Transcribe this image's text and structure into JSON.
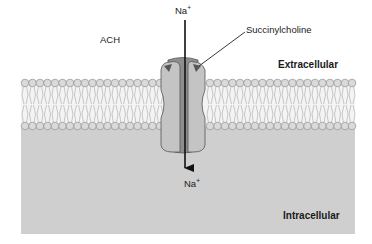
{
  "figure": {
    "labels": {
      "ach": "ACH",
      "succinylcholine": "Succinylcholine",
      "extracellular": "Extracellular",
      "intracellular": "Intracellular",
      "ion_top": {
        "base": "Na",
        "charge": "+"
      },
      "ion_bottom": {
        "base": "Na",
        "charge": "+"
      }
    },
    "colors": {
      "background": "#ffffff",
      "intracellular_fill": "#cfcfcf",
      "lipid_head": "#d9d9d9",
      "lipid_outline": "#9a9a9a",
      "channel_outer": "#c4c4c4",
      "channel_pore": "#8e8e8e",
      "channel_outline": "#555555",
      "binding_site": "#555555",
      "arrow": "#111111"
    },
    "arrow": {
      "direction": "down",
      "meaning": "Na+ influx through open channel"
    }
  }
}
